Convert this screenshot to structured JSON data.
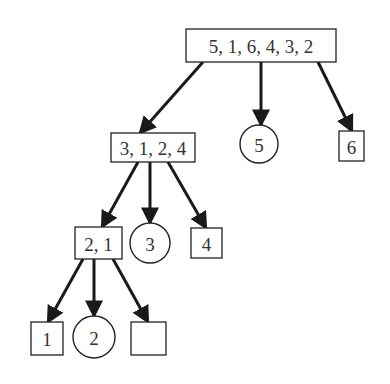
{
  "diagram": {
    "type": "partition-tree",
    "colors": {
      "stroke": "#222222",
      "text": "#333333",
      "background": "#ffffff"
    },
    "nodes": [
      {
        "id": "root",
        "shape": "rect",
        "label": "5, 1, 6, 4, 3, 2",
        "x": 186,
        "y": 29,
        "w": 150,
        "h": 33
      },
      {
        "id": "l2a",
        "shape": "rect",
        "label": "3, 1, 2, 4",
        "x": 111,
        "y": 133,
        "w": 84,
        "h": 29
      },
      {
        "id": "p5",
        "shape": "circle",
        "label": "5",
        "cx": 259,
        "cy": 144,
        "r": 19
      },
      {
        "id": "r6",
        "shape": "rect",
        "label": "6",
        "x": 339,
        "y": 131,
        "w": 25,
        "h": 30
      },
      {
        "id": "l3a",
        "shape": "rect",
        "label": "2, 1",
        "x": 75,
        "y": 227,
        "w": 47,
        "h": 32
      },
      {
        "id": "p3",
        "shape": "circle",
        "label": "3",
        "cx": 150,
        "cy": 243,
        "r": 20
      },
      {
        "id": "r4",
        "shape": "rect",
        "label": "4",
        "x": 191,
        "y": 228,
        "w": 31,
        "h": 30
      },
      {
        "id": "l1",
        "shape": "rect",
        "label": "1",
        "x": 31,
        "y": 322,
        "w": 32,
        "h": 33
      },
      {
        "id": "p2",
        "shape": "circle",
        "label": "2",
        "cx": 94,
        "cy": 337,
        "r": 21
      },
      {
        "id": "empty",
        "shape": "rect",
        "label": "",
        "x": 131,
        "y": 322,
        "w": 35,
        "h": 33
      }
    ],
    "edges": [
      {
        "from": "root",
        "to": "l2a",
        "x1": 203,
        "y1": 62,
        "x2": 140,
        "y2": 133
      },
      {
        "from": "root",
        "to": "p5",
        "x1": 261,
        "y1": 62,
        "x2": 261,
        "y2": 125
      },
      {
        "from": "root",
        "to": "r6",
        "x1": 318,
        "y1": 62,
        "x2": 352,
        "y2": 131
      },
      {
        "from": "l2a",
        "to": "l3a",
        "x1": 138,
        "y1": 162,
        "x2": 102,
        "y2": 227
      },
      {
        "from": "l2a",
        "to": "p3",
        "x1": 150,
        "y1": 162,
        "x2": 150,
        "y2": 223
      },
      {
        "from": "l2a",
        "to": "r4",
        "x1": 168,
        "y1": 162,
        "x2": 206,
        "y2": 228
      },
      {
        "from": "l3a",
        "to": "l1",
        "x1": 83,
        "y1": 259,
        "x2": 48,
        "y2": 322
      },
      {
        "from": "l3a",
        "to": "p2",
        "x1": 94,
        "y1": 259,
        "x2": 94,
        "y2": 316
      },
      {
        "from": "l3a",
        "to": "empty",
        "x1": 113,
        "y1": 259,
        "x2": 148,
        "y2": 322
      }
    ]
  }
}
